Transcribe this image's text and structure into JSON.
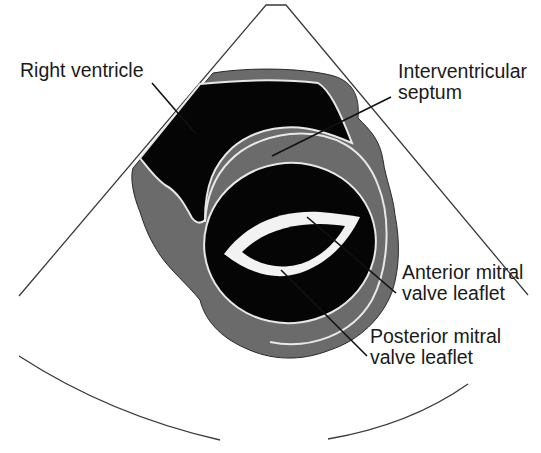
{
  "diagram": {
    "colors": {
      "background": "#ffffff",
      "myocardium": "#6b6b6b",
      "cavity": "#050505",
      "outline": "#e8e8e8",
      "leaflet": "#f2f2f2",
      "sector_line": "#3a3a3a",
      "leader_line": "#111111",
      "text": "#1a1a1a"
    },
    "labels": [
      {
        "id": "right-ventricle",
        "lines": [
          "Right ventricle"
        ],
        "x": 20,
        "y": 60
      },
      {
        "id": "interventricular-septum",
        "lines": [
          "Interventricular",
          "septum"
        ],
        "x": 398,
        "y": 61
      },
      {
        "id": "anterior-mitral-valve-leaflet",
        "lines": [
          "Anterior mitral",
          "valve leaflet"
        ],
        "x": 402,
        "y": 262
      },
      {
        "id": "posterior-mitral-valve-leaflet",
        "lines": [
          "Posterior mitral",
          "valve leaflet"
        ],
        "x": 370,
        "y": 326
      }
    ],
    "leaders": [
      {
        "id": "right-ventricle",
        "x1": 152,
        "y1": 83,
        "x2": 196,
        "y2": 134
      },
      {
        "id": "interventricular-septum",
        "x1": 391,
        "y1": 97,
        "x2": 272,
        "y2": 156
      },
      {
        "id": "anterior-mitral-valve-leaflet",
        "x1": 396,
        "y1": 293,
        "x2": 307,
        "y2": 217
      },
      {
        "id": "posterior-mitral-valve-leaflet",
        "x1": 367,
        "y1": 356,
        "x2": 281,
        "y2": 270
      }
    ],
    "sector": {
      "apex_left": [
        266,
        5
      ],
      "apex_right": [
        286,
        5
      ],
      "left_end": [
        19,
        296
      ],
      "right_end": [
        528,
        295
      ],
      "arc_left": {
        "from": [
          19,
          356
        ],
        "ctrl": [
          110,
          415
        ],
        "to": [
          220,
          440
        ]
      },
      "arc_right": {
        "from": [
          328,
          439
        ],
        "ctrl": [
          410,
          425
        ],
        "to": [
          468,
          384
        ]
      }
    }
  }
}
